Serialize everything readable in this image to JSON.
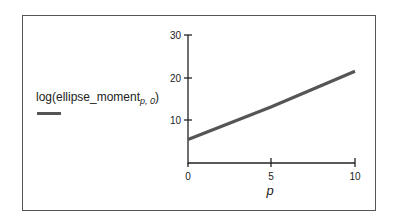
{
  "chart_data": {
    "type": "line",
    "title": "",
    "xlabel": "p",
    "ylabel": "",
    "xlim": [
      0,
      10
    ],
    "ylim": [
      0,
      30
    ],
    "xticks": [
      0,
      5,
      10
    ],
    "yticks": [
      10,
      20,
      30
    ],
    "grid": false,
    "legend_position": "left",
    "series": [
      {
        "name": "log(ellipse_moment_{p,0})",
        "color": "#555555",
        "x": [
          0,
          5,
          10
        ],
        "values": [
          5.5,
          13.2,
          21.5
        ]
      }
    ]
  },
  "legend": {
    "label_main": "log(ellipse_moment",
    "label_sub": "p, 0",
    "label_close": ")"
  },
  "axis": {
    "x_ticks": [
      "0",
      "5",
      "10"
    ],
    "y_ticks": [
      "10",
      "20",
      "30"
    ],
    "x_label": "p"
  }
}
